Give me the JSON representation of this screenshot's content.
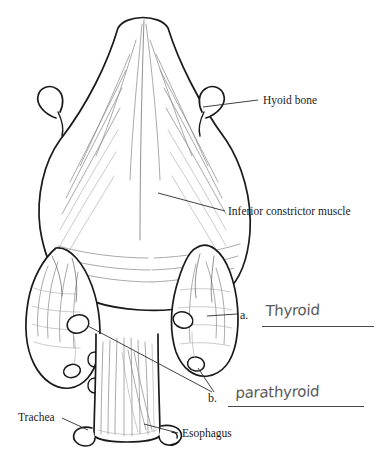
{
  "figure": {
    "background_color": "#ffffff",
    "ink_color": "#1a1a1a",
    "shading_color": "#8a8a8a",
    "handwriting_color": "#5a5a5a"
  },
  "labels": [
    {
      "id": "hyoid",
      "text": "Hyoid bone"
    },
    {
      "id": "constrictor",
      "text": "Inferior constrictor muscle"
    },
    {
      "id": "trachea",
      "text": "Trachea"
    },
    {
      "id": "esophagus",
      "text": "Esophagus"
    }
  ],
  "questions": [
    {
      "marker": "a.",
      "answer": "Thyroid"
    },
    {
      "marker": "b.",
      "answer": "parathyroid"
    }
  ]
}
